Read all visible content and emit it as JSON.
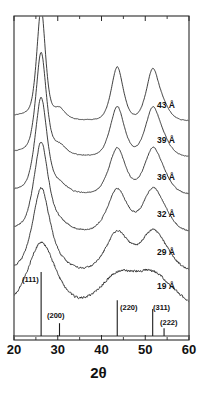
{
  "figure": {
    "kind": "xrd-diffraction-pattern-stack",
    "background_color": "#ffffff",
    "line_color": "#1c1c1c",
    "axis_color": "#2a2a2a"
  },
  "axes": {
    "x_title": "2θ",
    "x_min": 20,
    "x_max": 60,
    "x_major_ticks": [
      20,
      30,
      40,
      50,
      60
    ],
    "x_major_tick_labels": [
      "20",
      "30",
      "40",
      "50",
      "60"
    ],
    "x_minor_ticks": [
      25,
      35,
      45,
      55
    ],
    "y_title": "",
    "y_tick_labels": [],
    "frame": {
      "left": 14,
      "top": 16,
      "right": 189,
      "bottom": 340
    }
  },
  "traces": [
    {
      "label": "43 Å",
      "size_angstrom": 43,
      "baseline_y": 122,
      "label_x": 157,
      "label_y": 108,
      "broadening": 1.0,
      "noise": 0.3,
      "amp": 1.0
    },
    {
      "label": "39 Å",
      "size_angstrom": 39,
      "baseline_y": 158,
      "label_x": 157,
      "label_y": 143,
      "broadening": 1.18,
      "noise": 0.4,
      "amp": 0.93
    },
    {
      "label": "36 Å",
      "size_angstrom": 36,
      "baseline_y": 196,
      "label_x": 157,
      "label_y": 180,
      "broadening": 1.38,
      "noise": 0.55,
      "amp": 0.86
    },
    {
      "label": "32 Å",
      "size_angstrom": 32,
      "baseline_y": 234,
      "label_x": 157,
      "label_y": 217,
      "broadening": 1.62,
      "noise": 0.75,
      "amp": 0.8
    },
    {
      "label": "29 Å",
      "size_angstrom": 29,
      "baseline_y": 274,
      "label_x": 157,
      "label_y": 255,
      "broadening": 1.95,
      "noise": 1.0,
      "amp": 0.74
    },
    {
      "label": "19 Å",
      "size_angstrom": 19,
      "baseline_y": 312,
      "label_x": 157,
      "label_y": 289,
      "broadening": 3.1,
      "noise": 1.25,
      "amp": 0.58
    }
  ],
  "reflections": [
    {
      "hkl": "(111)",
      "two_theta": 26.2,
      "rel_intensity": 1.0,
      "label_x": 22,
      "label_y": 282
    },
    {
      "hkl": "(200)",
      "two_theta": 30.4,
      "rel_intensity": 0.2,
      "label_x": 47,
      "label_y": 318
    },
    {
      "hkl": "(220)",
      "two_theta": 43.6,
      "rel_intensity": 0.56,
      "label_x": 120,
      "label_y": 310
    },
    {
      "hkl": "(311)",
      "two_theta": 51.7,
      "rel_intensity": 0.42,
      "label_x": 153,
      "label_y": 310
    },
    {
      "hkl": "(222)",
      "two_theta": 54.3,
      "rel_intensity": 0.12,
      "label_x": 160,
      "label_y": 325
    }
  ],
  "stick_pattern": {
    "baseline_y": 336,
    "max_height": 64
  },
  "chart_data": {
    "type": "line",
    "title": "",
    "xlabel": "2θ",
    "ylabel": "Intensity (a.u.)",
    "xlim": [
      20,
      60
    ],
    "grid": false,
    "legend": "inline-right",
    "x_major_ticks": [
      20,
      30,
      40,
      50,
      60
    ],
    "x_minor_ticks": [
      25,
      35,
      45,
      55
    ],
    "series": [
      {
        "name": "43 Å",
        "peaks": [
          {
            "two_theta": 26.2,
            "height": 1.0,
            "width": 1.05
          },
          {
            "two_theta": 43.6,
            "height": 0.5,
            "width": 1.45
          },
          {
            "two_theta": 51.7,
            "height": 0.46,
            "width": 1.55
          }
        ]
      },
      {
        "name": "39 Å",
        "peaks": [
          {
            "two_theta": 26.2,
            "height": 0.93,
            "width": 1.25
          },
          {
            "two_theta": 43.6,
            "height": 0.4,
            "width": 1.75
          },
          {
            "two_theta": 51.7,
            "height": 0.38,
            "width": 1.85
          }
        ]
      },
      {
        "name": "36 Å",
        "peaks": [
          {
            "two_theta": 26.2,
            "height": 0.86,
            "width": 1.45
          },
          {
            "two_theta": 43.6,
            "height": 0.34,
            "width": 2.05
          },
          {
            "two_theta": 51.7,
            "height": 0.33,
            "width": 2.15
          }
        ]
      },
      {
        "name": "32 Å",
        "peaks": [
          {
            "two_theta": 26.2,
            "height": 0.8,
            "width": 1.7
          },
          {
            "two_theta": 43.6,
            "height": 0.3,
            "width": 2.45
          },
          {
            "two_theta": 51.7,
            "height": 0.29,
            "width": 2.55
          }
        ]
      },
      {
        "name": "29 Å",
        "peaks": [
          {
            "two_theta": 26.2,
            "height": 0.74,
            "width": 2.05
          },
          {
            "two_theta": 43.6,
            "height": 0.26,
            "width": 2.95
          },
          {
            "two_theta": 51.7,
            "height": 0.25,
            "width": 3.05
          }
        ]
      },
      {
        "name": "19 Å",
        "peaks": [
          {
            "two_theta": 26.2,
            "height": 0.58,
            "width": 3.3
          },
          {
            "two_theta": 43.6,
            "height": 0.18,
            "width": 4.4
          },
          {
            "two_theta": 51.7,
            "height": 0.17,
            "width": 4.6
          }
        ]
      }
    ],
    "reference_sticks": {
      "labels": [
        "(111)",
        "(200)",
        "(220)",
        "(311)",
        "(222)"
      ],
      "two_theta": [
        26.2,
        30.4,
        43.6,
        51.7,
        54.3
      ],
      "rel_intensity": [
        1.0,
        0.2,
        0.56,
        0.42,
        0.12
      ]
    }
  }
}
